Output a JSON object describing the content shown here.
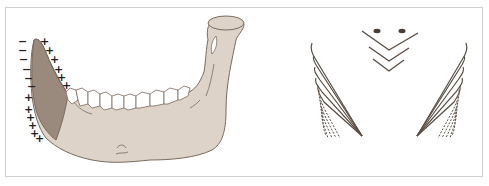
{
  "figure": {
    "panels": [
      {
        "id": "mandible",
        "description": "Lateral view of mandible with shaded anterior region and surface charge markings",
        "minus_signs": [
          "−",
          "−",
          "−",
          "−",
          "−",
          "−"
        ],
        "plus_signs_outer": [
          "+",
          "+",
          "+",
          "+",
          "+",
          "+"
        ],
        "plus_signs_inner": [
          "+",
          "+",
          "+",
          "+",
          "+",
          "+"
        ]
      },
      {
        "id": "schematic",
        "description": "Symmetric schematic of curved solid and dashed lines converging to points, with two dots and three nested chevrons at top center"
      }
    ],
    "colors": {
      "bone": "#ddd3c8",
      "bone_shaded": "#9a8a7e",
      "outline": "#7a6a5e",
      "teeth": "#ffffff",
      "line": "#5a4e44",
      "dot": "#4a3e34",
      "frame": "#cfcfcf"
    }
  }
}
